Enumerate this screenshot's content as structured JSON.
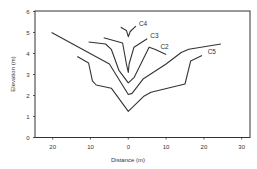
{
  "chart_data": {
    "type": "line",
    "title": "",
    "xlabel": "Distance (m)",
    "ylabel": "Elevation (m)",
    "xlim": [
      -25,
      32
    ],
    "ylim": [
      0,
      6
    ],
    "grid": false,
    "legend": "inline labels",
    "x_ticks": [
      -20,
      -10,
      0,
      10,
      20,
      30
    ],
    "x_tick_labels": [
      "20",
      "10",
      "0",
      "10",
      "20",
      "30"
    ],
    "y_ticks": [
      0,
      1,
      2,
      3,
      4,
      5,
      6
    ],
    "y_tick_labels": [
      "0",
      "1",
      "2",
      "3",
      "4",
      "5",
      "6"
    ],
    "series": [
      {
        "name": "",
        "label": "",
        "points": [
          [
            -20.3,
            5.0
          ],
          [
            -5,
            3.5
          ],
          [
            0,
            2.05
          ],
          [
            1,
            2.1
          ],
          [
            4,
            2.8
          ],
          [
            10,
            3.5
          ],
          [
            14,
            4.05
          ],
          [
            16,
            4.2
          ],
          [
            24.5,
            4.45
          ]
        ]
      },
      {
        "name": "C5",
        "label": "C5",
        "label_pos": [
          21,
          4.0
        ],
        "points": [
          [
            -13.5,
            3.85
          ],
          [
            -10.5,
            3.55
          ],
          [
            -9.5,
            2.7
          ],
          [
            -8.5,
            2.5
          ],
          [
            -4.5,
            2.35
          ],
          [
            0,
            1.25
          ],
          [
            4,
            1.95
          ],
          [
            6,
            2.15
          ],
          [
            15,
            2.55
          ],
          [
            16.5,
            3.65
          ],
          [
            19.5,
            3.9
          ]
        ]
      },
      {
        "name": "C2",
        "label": "C2",
        "label_pos": [
          8.5,
          4.2
        ],
        "points": [
          [
            -10.5,
            4.55
          ],
          [
            -6,
            4.45
          ],
          [
            -4.5,
            4.2
          ],
          [
            -2.5,
            3.2
          ],
          [
            0,
            2.6
          ],
          [
            1.5,
            2.85
          ],
          [
            5.5,
            4.3
          ],
          [
            7,
            4.2
          ],
          [
            10,
            3.95
          ]
        ]
      },
      {
        "name": "C3",
        "label": "C3",
        "label_pos": [
          5.8,
          4.75
        ],
        "points": [
          [
            -6.5,
            4.75
          ],
          [
            -1.5,
            4.5
          ],
          [
            -0.5,
            3.5
          ],
          [
            0,
            3.1
          ],
          [
            0.2,
            3.5
          ],
          [
            1.5,
            4.3
          ],
          [
            5,
            4.7
          ]
        ]
      },
      {
        "name": "C4",
        "label": "C4",
        "label_pos": [
          2.8,
          5.3
        ],
        "points": [
          [
            -2,
            5.25
          ],
          [
            -0.5,
            5.1
          ],
          [
            0,
            4.8
          ],
          [
            0.5,
            5.05
          ],
          [
            2,
            5.3
          ]
        ]
      }
    ]
  }
}
